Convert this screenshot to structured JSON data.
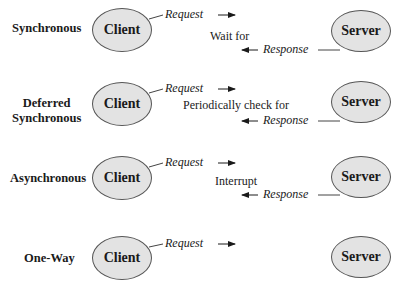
{
  "diagram": {
    "rows": [
      {
        "mode": "Synchronous",
        "client": "Client",
        "server": "Server",
        "request": "Request",
        "action": "Wait for",
        "response": "Response"
      },
      {
        "mode_line1": "Deferred",
        "mode_line2": "Synchronous",
        "client": "Client",
        "server": "Server",
        "request": "Request",
        "action": "Periodically check for",
        "response": "Response"
      },
      {
        "mode": "Asynchronous",
        "client": "Client",
        "server": "Server",
        "request": "Request",
        "action": "Interrupt",
        "response": "Response"
      },
      {
        "mode": "One-Way",
        "client": "Client",
        "server": "Server",
        "request": "Request"
      }
    ],
    "colors": {
      "node_fill": "#e3e3e3",
      "node_stroke": "#555555",
      "text": "#1a1a1a"
    }
  }
}
